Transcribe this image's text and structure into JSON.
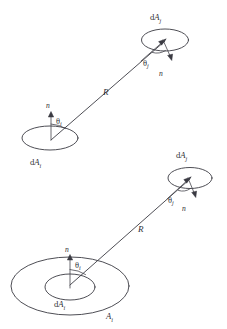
{
  "figure": {
    "background_color": "#ffffff",
    "line_color": "#3a3a42",
    "text_color": "#2f2f36"
  },
  "panels": [
    {
      "id": "top",
      "name": "differential-to-differential",
      "elements": {
        "source_patch_label_d": "d",
        "source_patch_label_A": "A",
        "source_patch_label_sub": "i",
        "target_patch_label_d": "d",
        "target_patch_label_A": "A",
        "target_patch_label_sub": "j",
        "source_normal_label": "n",
        "target_normal_label": "n",
        "source_angle_label": "θ",
        "source_angle_sub": "i",
        "target_angle_label": "θ",
        "target_angle_sub": "j",
        "distance_label": "R"
      }
    },
    {
      "id": "bottom",
      "name": "finite-area-to-differential",
      "elements": {
        "source_patch_label_d": "d",
        "source_patch_label_A": "A",
        "source_patch_label_sub": "i",
        "finite_area_label_A": "A",
        "finite_area_label_sub": "i",
        "target_patch_label_d": "d",
        "target_patch_label_A": "A",
        "target_patch_label_sub": "j",
        "source_normal_label": "n",
        "target_normal_label": "n",
        "source_angle_label": "θ",
        "source_angle_sub": "i",
        "target_angle_label": "θ",
        "target_angle_sub": "j",
        "distance_label": "R"
      }
    }
  ]
}
